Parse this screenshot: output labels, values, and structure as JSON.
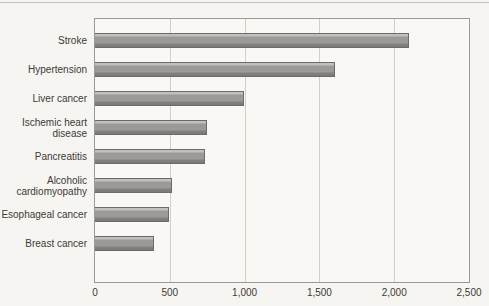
{
  "page": {
    "background_color": "#f7f5f1",
    "top_rule_color": "#c3c1bd"
  },
  "chart_data": {
    "type": "bar",
    "orientation": "horizontal",
    "title": "",
    "xlabel": "",
    "ylabel": "",
    "categories": [
      "Stroke",
      "Hypertension",
      "Liver cancer",
      "Ischemic heart disease",
      "Pancreatitis",
      "Alcoholic cardiomyopathy",
      "Esophageal cancer",
      "Breast cancer"
    ],
    "values": [
      2090,
      1600,
      990,
      740,
      730,
      510,
      490,
      390
    ],
    "xlim": [
      0,
      2500
    ],
    "x_ticks": [
      0,
      500,
      1000,
      1500,
      2000,
      2500
    ],
    "x_tick_labels": [
      "0",
      "500",
      "1,000",
      "1,500",
      "2,000",
      "2,500"
    ],
    "grid": true,
    "legend": false,
    "bar_color": "#9c9a98",
    "bar_border_color": "#6d6b69",
    "gridline_color": "#d2cfcb",
    "plot_border_color": "#9c9a97",
    "plot_background": "#faf8f5",
    "text_color": "#3c3a37"
  }
}
